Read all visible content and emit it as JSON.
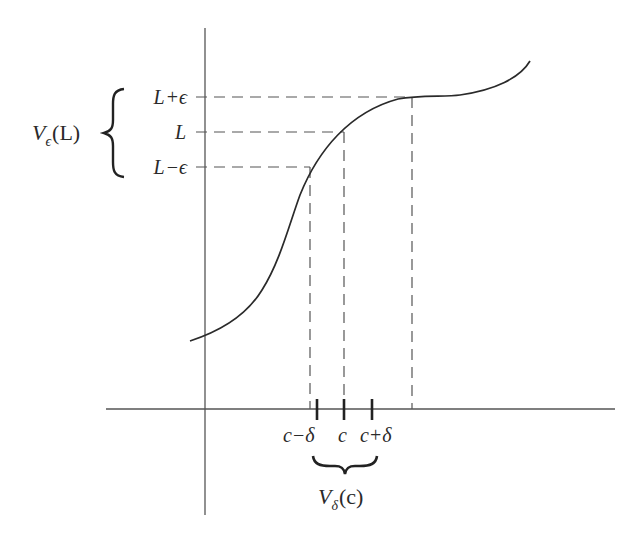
{
  "diagram": {
    "colors": {
      "stroke": "#2a2a2a",
      "axis": "#555555",
      "dash": "#555555",
      "background": "#ffffff"
    },
    "y_labels": {
      "upper": {
        "base": "L",
        "op": "+",
        "sym": "ϵ"
      },
      "middle": {
        "base": "L"
      },
      "lower": {
        "base": "L",
        "op": "−",
        "sym": "ϵ"
      }
    },
    "y_neighborhood": {
      "base": "V",
      "sub": "ϵ",
      "arg": "(L)"
    },
    "x_labels": {
      "left": {
        "base": "c",
        "op": "−",
        "sym": "δ"
      },
      "middle": {
        "base": "c"
      },
      "right": {
        "base": "c",
        "op": "+",
        "sym": "δ"
      }
    },
    "x_neighborhood": {
      "base": "V",
      "sub": "δ",
      "arg": "(c)"
    },
    "levels_px": {
      "L_plus_eps": 97,
      "L": 132,
      "L_minus_eps": 167
    },
    "verticals_px": {
      "x_lower": 310,
      "c": 344,
      "x_upper": 412
    },
    "ticks_px": {
      "c_minus_delta": 317,
      "c": 344,
      "c_plus_delta": 372
    }
  }
}
